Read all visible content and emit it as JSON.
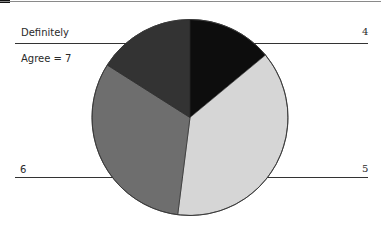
{
  "chart_data": {
    "type": "pie",
    "title": "",
    "categories": [
      "4",
      "5",
      "6",
      "Definitely Agree = 7"
    ],
    "values": [
      14,
      38,
      32,
      16
    ],
    "unit": "approx. percent (estimated from slice angles)",
    "start_angle_deg": 0,
    "direction": "clockwise",
    "colors": [
      "#0d0d0d",
      "#d6d6d6",
      "#6e6e6e",
      "#333333"
    ],
    "legend": "none (labels attached via leader lines)",
    "grid": false
  },
  "labels": {
    "seven_line1": "Definitely",
    "seven_line2": "Agree = 7",
    "four": "4",
    "five": "5",
    "six": "6"
  }
}
